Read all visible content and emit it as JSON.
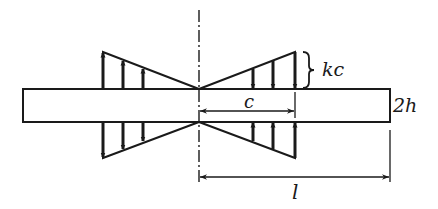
{
  "diagram": {
    "labels": {
      "load_magnitude": "kc",
      "load_length": "c",
      "beam_depth": "2h",
      "half_length": "l"
    },
    "colors": {
      "stroke": "#1a1a1a",
      "background": "#ffffff"
    }
  }
}
